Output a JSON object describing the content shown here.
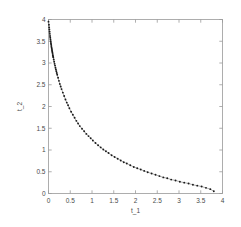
{
  "chart_data": {
    "type": "scatter",
    "title": "",
    "xlabel": "t_1",
    "ylabel": "t_2",
    "xlim": [
      0,
      4
    ],
    "ylim": [
      0,
      4
    ],
    "grid": false,
    "legend": null,
    "xticks": [
      "0",
      "0.5",
      "1",
      "1.5",
      "2",
      "2.5",
      "3",
      "3.5",
      "4"
    ],
    "xtick_values": [
      0,
      0.5,
      1,
      1.5,
      2,
      2.5,
      3,
      3.5,
      4
    ],
    "yticks": [
      "0",
      "0.5",
      "1",
      "1.5",
      "2",
      "2.5",
      "3",
      "3.5",
      "4"
    ],
    "ytick_values": [
      0,
      0.5,
      1,
      1.5,
      2,
      2.5,
      3,
      3.5,
      4
    ],
    "marker": "dot",
    "marker_color": "#1a1a1a",
    "line_color": "#8a8a8a",
    "series": [
      {
        "name": "pareto-front",
        "x": [
          0.0,
          0.01,
          0.015,
          0.02,
          0.025,
          0.03,
          0.035,
          0.04,
          0.045,
          0.05,
          0.055,
          0.06,
          0.065,
          0.07,
          0.075,
          0.08,
          0.085,
          0.09,
          0.095,
          0.1,
          0.105,
          0.11,
          0.12,
          0.13,
          0.14,
          0.15,
          0.16,
          0.17,
          0.18,
          0.19,
          0.2,
          0.22,
          0.24,
          0.26,
          0.28,
          0.3,
          0.33,
          0.36,
          0.39,
          0.42,
          0.45,
          0.48,
          0.52,
          0.56,
          0.6,
          0.64,
          0.68,
          0.72,
          0.77,
          0.82,
          0.87,
          0.92,
          0.97,
          1.02,
          1.08,
          1.14,
          1.2,
          1.26,
          1.32,
          1.38,
          1.45,
          1.52,
          1.59,
          1.66,
          1.73,
          1.8,
          1.88,
          1.96,
          2.04,
          2.12,
          2.2,
          2.28,
          2.37,
          2.46,
          2.55,
          2.64,
          2.73,
          2.82,
          2.92,
          3.02,
          3.12,
          3.22,
          3.32,
          3.42,
          3.52,
          3.62,
          3.72,
          3.8
        ],
        "y": [
          3.95,
          3.88,
          3.82,
          3.77,
          3.72,
          3.67,
          3.62,
          3.58,
          3.54,
          3.5,
          3.46,
          3.43,
          3.39,
          3.36,
          3.33,
          3.3,
          3.27,
          3.24,
          3.21,
          3.18,
          3.15,
          3.13,
          3.08,
          3.03,
          2.98,
          2.94,
          2.89,
          2.85,
          2.81,
          2.77,
          2.73,
          2.66,
          2.59,
          2.52,
          2.46,
          2.4,
          2.32,
          2.24,
          2.16,
          2.09,
          2.03,
          1.96,
          1.88,
          1.81,
          1.74,
          1.67,
          1.61,
          1.55,
          1.49,
          1.43,
          1.37,
          1.32,
          1.27,
          1.22,
          1.16,
          1.11,
          1.06,
          1.01,
          0.97,
          0.93,
          0.88,
          0.84,
          0.8,
          0.76,
          0.72,
          0.69,
          0.65,
          0.61,
          0.58,
          0.55,
          0.52,
          0.49,
          0.46,
          0.43,
          0.4,
          0.37,
          0.35,
          0.32,
          0.3,
          0.27,
          0.25,
          0.23,
          0.2,
          0.18,
          0.16,
          0.13,
          0.1,
          0.05
        ]
      }
    ]
  },
  "figure": {
    "background_color": "#ffffff",
    "axis_color": "#9a9a9a",
    "text_color": "#4a4a4a"
  }
}
